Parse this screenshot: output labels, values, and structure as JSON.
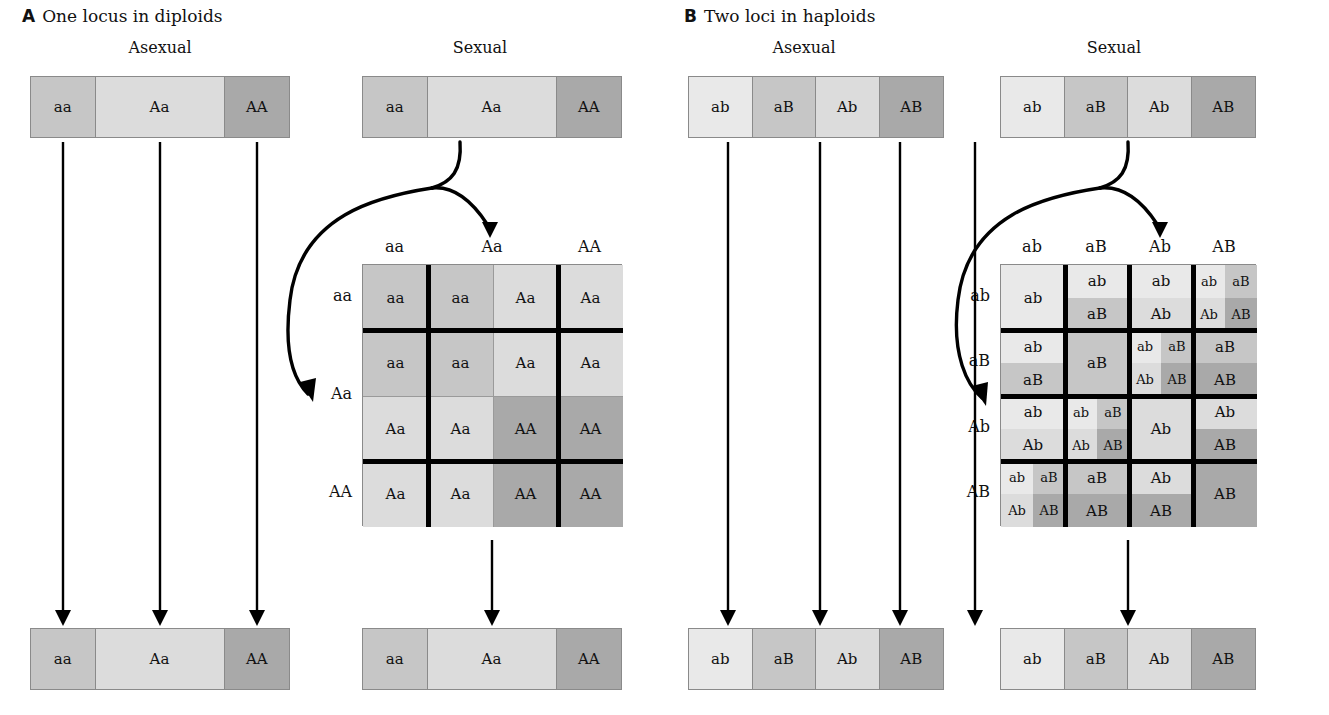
{
  "figure": {
    "panels": [
      {
        "letter": "A",
        "title": "One locus in diploids",
        "columns": [
          {
            "heading": "Asexual"
          },
          {
            "heading": "Sexual"
          }
        ]
      },
      {
        "letter": "B",
        "title": "Two loci in haploids",
        "columns": [
          {
            "heading": "Asexual"
          },
          {
            "heading": "Sexual"
          }
        ]
      }
    ]
  },
  "colors": {
    "lightest": "#e9e9e9",
    "light": "#dcdcdc",
    "mid_light": "#d2d2d2",
    "mid": "#c6c6c6",
    "dark": "#a9a9a9",
    "border": "#8a8a8a",
    "rule": "#000000",
    "background": "#ffffff"
  },
  "panelA": {
    "asexual": {
      "bar_top": {
        "segments": [
          {
            "label": "aa",
            "width_pct": 25,
            "shade": "mid"
          },
          {
            "label": "Aa",
            "width_pct": 50,
            "shade": "light"
          },
          {
            "label": "AA",
            "width_pct": 25,
            "shade": "dark"
          }
        ]
      },
      "bar_bottom": {
        "segments": [
          {
            "label": "aa",
            "width_pct": 25,
            "shade": "mid"
          },
          {
            "label": "Aa",
            "width_pct": 50,
            "shade": "light"
          },
          {
            "label": "AA",
            "width_pct": 25,
            "shade": "dark"
          }
        ]
      },
      "arrows": 3
    },
    "sexual": {
      "bar_top": {
        "segments": [
          {
            "label": "aa",
            "width_pct": 25,
            "shade": "mid"
          },
          {
            "label": "Aa",
            "width_pct": 50,
            "shade": "light"
          },
          {
            "label": "AA",
            "width_pct": 25,
            "shade": "dark"
          }
        ]
      },
      "bar_bottom": {
        "segments": [
          {
            "label": "aa",
            "width_pct": 25,
            "shade": "mid"
          },
          {
            "label": "Aa",
            "width_pct": 50,
            "shade": "light"
          },
          {
            "label": "AA",
            "width_pct": 25,
            "shade": "dark"
          }
        ]
      },
      "punnett": {
        "col_headers": [
          {
            "label": "aa",
            "span": 1
          },
          {
            "label": "Aa",
            "span": 2
          },
          {
            "label": "AA",
            "span": 1
          }
        ],
        "row_headers": [
          {
            "label": "aa",
            "span": 1
          },
          {
            "label": "Aa",
            "span": 2
          },
          {
            "label": "AA",
            "span": 1
          }
        ],
        "cells": [
          [
            {
              "label": "aa",
              "shade": "mid"
            },
            {
              "label": "aa",
              "shade": "mid"
            },
            {
              "label": "Aa",
              "shade": "light"
            },
            {
              "label": "Aa",
              "shade": "light"
            }
          ],
          [
            {
              "label": "aa",
              "shade": "mid"
            },
            {
              "label": "aa",
              "shade": "mid"
            },
            {
              "label": "Aa",
              "shade": "light"
            },
            {
              "label": "Aa",
              "shade": "light"
            }
          ],
          [
            {
              "label": "Aa",
              "shade": "light"
            },
            {
              "label": "Aa",
              "shade": "light"
            },
            {
              "label": "AA",
              "shade": "dark"
            },
            {
              "label": "AA",
              "shade": "dark"
            }
          ],
          [
            {
              "label": "Aa",
              "shade": "light"
            },
            {
              "label": "Aa",
              "shade": "light"
            },
            {
              "label": "AA",
              "shade": "dark"
            },
            {
              "label": "AA",
              "shade": "dark"
            }
          ]
        ]
      },
      "arrows": 1
    }
  },
  "panelB": {
    "asexual": {
      "bar_top": {
        "segments": [
          {
            "label": "ab",
            "width_pct": 25,
            "shade": "lightest"
          },
          {
            "label": "aB",
            "width_pct": 25,
            "shade": "mid"
          },
          {
            "label": "Ab",
            "width_pct": 25,
            "shade": "light"
          },
          {
            "label": "AB",
            "width_pct": 25,
            "shade": "dark"
          }
        ]
      },
      "bar_bottom": {
        "segments": [
          {
            "label": "ab",
            "width_pct": 25,
            "shade": "lightest"
          },
          {
            "label": "aB",
            "width_pct": 25,
            "shade": "mid"
          },
          {
            "label": "Ab",
            "width_pct": 25,
            "shade": "light"
          },
          {
            "label": "AB",
            "width_pct": 25,
            "shade": "dark"
          }
        ]
      },
      "arrows": 4
    },
    "sexual": {
      "bar_top": {
        "segments": [
          {
            "label": "ab",
            "width_pct": 25,
            "shade": "lightest"
          },
          {
            "label": "aB",
            "width_pct": 25,
            "shade": "mid"
          },
          {
            "label": "Ab",
            "width_pct": 25,
            "shade": "light"
          },
          {
            "label": "AB",
            "width_pct": 25,
            "shade": "dark"
          }
        ]
      },
      "bar_bottom": {
        "segments": [
          {
            "label": "ab",
            "width_pct": 25,
            "shade": "lightest"
          },
          {
            "label": "aB",
            "width_pct": 25,
            "shade": "mid"
          },
          {
            "label": "Ab",
            "width_pct": 25,
            "shade": "light"
          },
          {
            "label": "AB",
            "width_pct": 25,
            "shade": "dark"
          }
        ]
      },
      "punnett": {
        "col_headers": [
          {
            "label": "ab"
          },
          {
            "label": "aB"
          },
          {
            "label": "Ab"
          },
          {
            "label": "AB"
          }
        ],
        "row_headers": [
          {
            "label": "ab"
          },
          {
            "label": "aB"
          },
          {
            "label": "Ab"
          },
          {
            "label": "AB"
          }
        ],
        "cells": [
          [
            {
              "split": "none",
              "parts": [
                {
                  "label": "ab",
                  "shade": "lightest"
                }
              ]
            },
            {
              "split": "h",
              "parts": [
                {
                  "label": "ab",
                  "shade": "lightest"
                },
                {
                  "label": "aB",
                  "shade": "mid"
                }
              ]
            },
            {
              "split": "h",
              "parts": [
                {
                  "label": "ab",
                  "shade": "lightest"
                },
                {
                  "label": "Ab",
                  "shade": "light"
                }
              ]
            },
            {
              "split": "quad",
              "parts": [
                {
                  "label": "ab",
                  "shade": "lightest"
                },
                {
                  "label": "aB",
                  "shade": "mid"
                },
                {
                  "label": "Ab",
                  "shade": "light"
                },
                {
                  "label": "AB",
                  "shade": "dark"
                }
              ]
            }
          ],
          [
            {
              "split": "h",
              "parts": [
                {
                  "label": "ab",
                  "shade": "lightest"
                },
                {
                  "label": "aB",
                  "shade": "mid"
                }
              ]
            },
            {
              "split": "none",
              "parts": [
                {
                  "label": "aB",
                  "shade": "mid"
                }
              ]
            },
            {
              "split": "quad",
              "parts": [
                {
                  "label": "ab",
                  "shade": "lightest"
                },
                {
                  "label": "aB",
                  "shade": "mid"
                },
                {
                  "label": "Ab",
                  "shade": "light"
                },
                {
                  "label": "AB",
                  "shade": "dark"
                }
              ]
            },
            {
              "split": "h",
              "parts": [
                {
                  "label": "aB",
                  "shade": "mid"
                },
                {
                  "label": "AB",
                  "shade": "dark"
                }
              ]
            }
          ],
          [
            {
              "split": "h",
              "parts": [
                {
                  "label": "ab",
                  "shade": "lightest"
                },
                {
                  "label": "Ab",
                  "shade": "light"
                }
              ]
            },
            {
              "split": "quad",
              "parts": [
                {
                  "label": "ab",
                  "shade": "lightest"
                },
                {
                  "label": "aB",
                  "shade": "mid"
                },
                {
                  "label": "Ab",
                  "shade": "light"
                },
                {
                  "label": "AB",
                  "shade": "dark"
                }
              ]
            },
            {
              "split": "none",
              "parts": [
                {
                  "label": "Ab",
                  "shade": "light"
                }
              ]
            },
            {
              "split": "h",
              "parts": [
                {
                  "label": "Ab",
                  "shade": "light"
                },
                {
                  "label": "AB",
                  "shade": "dark"
                }
              ]
            }
          ],
          [
            {
              "split": "quad",
              "parts": [
                {
                  "label": "ab",
                  "shade": "lightest"
                },
                {
                  "label": "aB",
                  "shade": "mid"
                },
                {
                  "label": "Ab",
                  "shade": "light"
                },
                {
                  "label": "AB",
                  "shade": "dark"
                }
              ]
            },
            {
              "split": "h",
              "parts": [
                {
                  "label": "aB",
                  "shade": "mid"
                },
                {
                  "label": "AB",
                  "shade": "dark"
                }
              ]
            },
            {
              "split": "h",
              "parts": [
                {
                  "label": "Ab",
                  "shade": "light"
                },
                {
                  "label": "AB",
                  "shade": "dark"
                }
              ]
            },
            {
              "split": "none",
              "parts": [
                {
                  "label": "AB",
                  "shade": "dark"
                }
              ]
            }
          ]
        ]
      },
      "arrows": 1
    }
  }
}
